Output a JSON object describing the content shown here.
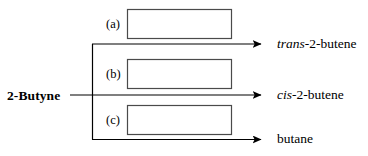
{
  "diagram": {
    "type": "reaction-scheme",
    "reactant": {
      "label": "2-Butyne"
    },
    "branches": [
      {
        "key": "(a)",
        "key_name": "a",
        "reagent_box_value": "",
        "reagent_box_placeholder": "",
        "product_prefix": "trans",
        "product_prefix_style": "italic",
        "product_rest": "-2-butene",
        "product_full": "trans-2-butene",
        "arrow": "right-arrow"
      },
      {
        "key": "(b)",
        "key_name": "b",
        "reagent_box_value": "",
        "reagent_box_placeholder": "",
        "product_prefix": "cis",
        "product_prefix_style": "italic",
        "product_rest": "-2-butene",
        "product_full": "cis-2-butene",
        "arrow": "right-arrow"
      },
      {
        "key": "(c)",
        "key_name": "c",
        "reagent_box_value": "",
        "reagent_box_placeholder": "",
        "product_prefix": "",
        "product_prefix_style": "normal",
        "product_rest": "butane",
        "product_full": "butane",
        "arrow": "right-arrow"
      }
    ],
    "colors": {
      "stroke": "#000000",
      "box_border": "#444444",
      "background": "#ffffff",
      "text": "#000000"
    }
  }
}
